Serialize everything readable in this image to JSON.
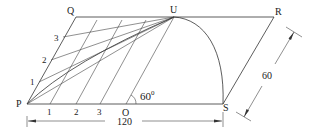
{
  "diagram": {
    "type": "geometric construction: parallelogram with curve via intersecting lines",
    "points": {
      "P": "P",
      "Q": "Q",
      "U": "U",
      "R": "R",
      "S": "S",
      "O": "O"
    },
    "side_divisions": [
      "1",
      "2",
      "3"
    ],
    "base_divisions": [
      "1",
      "2",
      "3"
    ],
    "angle_label": "60°",
    "angle_text": "60",
    "angle_sup": "0",
    "dimensions": {
      "base": "120",
      "slant": "60"
    }
  }
}
